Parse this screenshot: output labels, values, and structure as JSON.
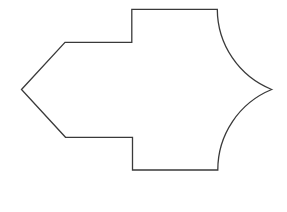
{
  "diagram": {
    "type": "outline-shape",
    "stroke_color": "#3a3a3a",
    "fill_color": "#ffffff",
    "background": "#ffffff",
    "vertices": {
      "left_tip": [
        21.5,
        89.5
      ],
      "upper_arm_corner": [
        65,
        42.3
      ],
      "upper_step_inner": [
        131.8,
        42.3
      ],
      "upper_step_outer": [
        131.8,
        9.3
      ],
      "top_right": [
        217.3,
        9.3
      ],
      "right_tip": [
        271.7,
        89.5
      ],
      "bottom_right": [
        217.8,
        170
      ],
      "lower_step_outer": [
        132.5,
        170
      ],
      "lower_step_inner": [
        132.5,
        137.3
      ],
      "lower_arm_corner": [
        65.5,
        137.3
      ]
    },
    "arc_radius": 86.8
  }
}
